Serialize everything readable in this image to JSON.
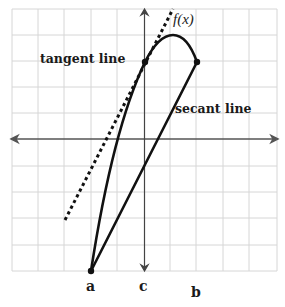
{
  "diagram": {
    "title": "",
    "labels": {
      "function": "f(x)",
      "tangent": "tangent line",
      "secant": "secant line",
      "point_a": "a",
      "point_b": "b",
      "point_c": "c"
    },
    "grid": {
      "x_lines": [
        12,
        38,
        64,
        91,
        117,
        144,
        170,
        196,
        223,
        249,
        277
      ],
      "y_lines": [
        9,
        35,
        61,
        87,
        113,
        139,
        166,
        192,
        218,
        245,
        271
      ],
      "color": "#d4d4d4"
    },
    "axes": {
      "x_axis_y": 139,
      "y_axis_x": 144,
      "color": "#555555"
    },
    "points": {
      "a": {
        "x": 91,
        "y": 271
      },
      "tangent_point": {
        "x": 145,
        "y": 62
      },
      "secant_end": {
        "x": 197,
        "y": 62
      }
    },
    "colors": {
      "curve": "#111111",
      "tangent": "#111111",
      "secant": "#111111",
      "grid": "#d4d4d4",
      "background": "#ffffff"
    }
  }
}
